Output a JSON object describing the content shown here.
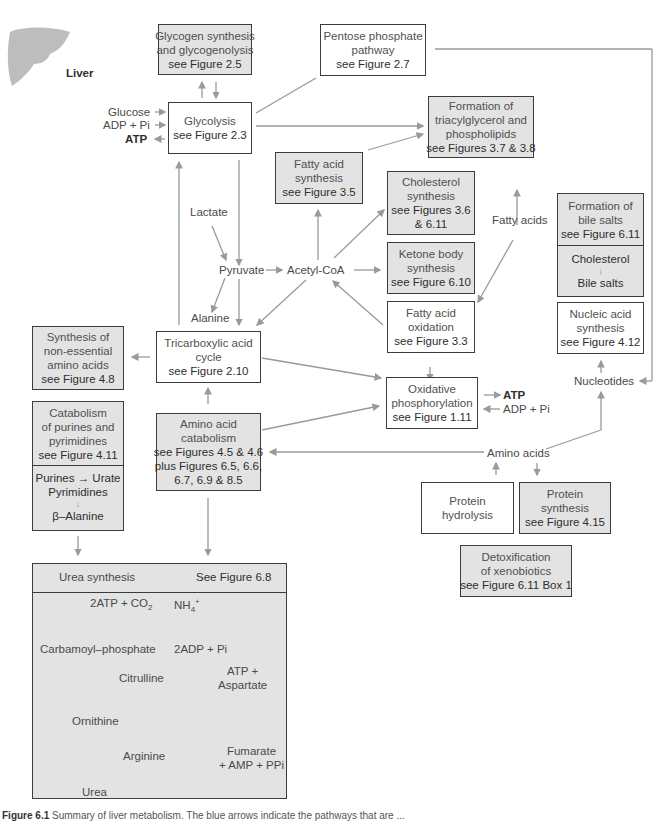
{
  "organ": {
    "name": "Liver",
    "icon": "liver-icon"
  },
  "boxes": {
    "glycogen": {
      "lines": [
        "Glycogen synthesis",
        "and glycogenolysis",
        "see Figure 2.5"
      ]
    },
    "pentose": {
      "lines": [
        "Pentose phosphate",
        "pathway",
        "see Figure 2.7"
      ]
    },
    "glycolysis": {
      "lines": [
        "Glycolysis",
        "see Figure 2.3"
      ]
    },
    "triacylglycerol": {
      "lines": [
        "Formation of",
        "triacylglycerol and",
        "phospholipids",
        "see Figures 3.7 & 3.8"
      ]
    },
    "fatty_acid_synthesis": {
      "lines": [
        "Fatty acid",
        "synthesis",
        "see Figure 3.5"
      ]
    },
    "cholesterol_synthesis": {
      "lines": [
        "Cholesterol",
        "synthesis",
        "see Figures 3.6",
        "& 6.11"
      ]
    },
    "ketone": {
      "lines": [
        "Ketone body",
        "synthesis",
        "see Figure 6.10"
      ]
    },
    "fatty_acid_oxidation": {
      "lines": [
        "Fatty acid",
        "oxidation",
        "see Figure 3.3"
      ]
    },
    "bile_salts": {
      "lines": [
        "Formation of",
        "bile salts",
        "see Figure 6.11"
      ],
      "sub": [
        "Cholesterol",
        "↓",
        "Bile salts"
      ]
    },
    "nucleic_acid": {
      "lines": [
        "Nucleic acid",
        "synthesis",
        "see Figure 4.12"
      ]
    },
    "nonessential_aa": {
      "lines": [
        "Synthesis of",
        "non-essential",
        "amino acids",
        "see Figure 4.8"
      ]
    },
    "tca": {
      "lines": [
        "Tricarboxylic acid",
        "cycle",
        "see Figure 2.10"
      ]
    },
    "oxphos": {
      "lines": [
        "Oxidative",
        "phosphorylation",
        "see Figure 1.11"
      ]
    },
    "purine_catabolism": {
      "lines": [
        "Catabolism",
        "of purines and",
        "pyrimidines",
        "see Figure 4.11"
      ],
      "sub": [
        "Purines → Urate",
        "Pyrimidines",
        "↓",
        "β–Alanine"
      ]
    },
    "aa_catabolism": {
      "lines": [
        "Amino acid",
        "catabolism",
        "see Figures 4.5 & 4.6",
        "plus Figures 6.5, 6.6,",
        "6.7, 6.9 & 8.5"
      ]
    },
    "protein_hydrolysis": {
      "lines": [
        "Protein",
        "hydrolysis"
      ]
    },
    "protein_synthesis": {
      "lines": [
        "Protein",
        "synthesis",
        "see Figure 4.15"
      ]
    },
    "detox": {
      "lines": [
        "Detoxification",
        "of xenobiotics",
        "see Figure 6.11 Box 1"
      ]
    }
  },
  "labels": {
    "glucose": "Glucose",
    "adp_pi_left": "ADP + Pi",
    "atp_left": "ATP",
    "lactate": "Lactate",
    "pyruvate": "Pyruvate",
    "acetyl_coa": "Acetyl-CoA",
    "alanine": "Alanine",
    "fatty_acids": "Fatty acids",
    "nucleotides": "Nucleotides",
    "atp_right": "ATP",
    "adp_pi_right": "ADP + Pi",
    "amino_acids": "Amino acids"
  },
  "urea": {
    "title": "Urea synthesis",
    "figure_ref": "See Figure 6.8",
    "inputs_top": "2ATP + CO",
    "co2_sub": "2",
    "nh4": "NH",
    "nh4_sub": "4",
    "nh4_sup": "+",
    "carbamoyl": "Carbamoyl–phosphate",
    "adp_out": "2ADP + Pi",
    "citrulline": "Citrulline",
    "atp_aspartate": [
      "ATP +",
      "Aspartate"
    ],
    "ornithine": "Ornithine",
    "arginine": "Arginine",
    "fumarate": [
      "Fumarate",
      "+ AMP + PPi"
    ],
    "urea": "Urea"
  },
  "caption": {
    "figure": "Figure 6.1",
    "text": "Summary of liver metabolism. The blue arrows indicate the pathways that are ..."
  },
  "colors": {
    "shaded_box": "#e3e3e3",
    "border": "#3c3c3c",
    "arrow": "#9a9a9a",
    "text": "#4a4a4a"
  }
}
